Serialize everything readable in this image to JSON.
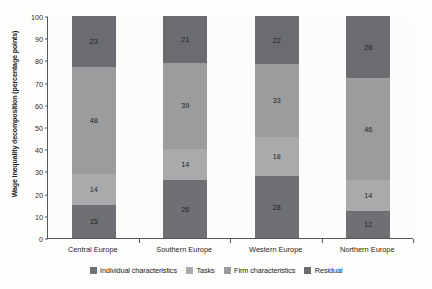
{
  "chart_data": {
    "type": "bar",
    "subtype": "stacked-bar",
    "title": "",
    "xlabel": "",
    "ylabel": "Wage inequality decomposition (percentage points)",
    "ylim": [
      0,
      100
    ],
    "ytick_step": 10,
    "yticks": [
      "100",
      "90",
      "80",
      "70",
      "60",
      "50",
      "40",
      "30",
      "20",
      "10",
      "0"
    ],
    "grid": false,
    "legend_position": "bottom-center",
    "categories": [
      "Central Europe",
      "Southern Europe",
      "Western Europe",
      "Northern Europe"
    ],
    "series": [
      {
        "name": "Individual characteristics",
        "color": "#6e7073",
        "values": [
          15,
          26,
          28,
          12
        ]
      },
      {
        "name": "Tasks",
        "color": "#a9aaac",
        "values": [
          14,
          14,
          18,
          14
        ]
      },
      {
        "name": "Firm characteristics",
        "color": "#9a9c9e",
        "values": [
          48,
          39,
          33,
          46
        ]
      },
      {
        "name": "Residual",
        "color": "#6a6c6f",
        "values": [
          23,
          21,
          22,
          28
        ]
      }
    ]
  },
  "legend": {
    "items": [
      {
        "label": "Individual characteristics",
        "color": "#6e7073"
      },
      {
        "label": "Tasks",
        "color": "#a9aaac"
      },
      {
        "label": "Firm characteristics",
        "color": "#9a9c9e"
      },
      {
        "label": "Residual",
        "color": "#6a6c6f"
      }
    ]
  },
  "axis": {
    "y_title": "Wage inequality decomposition (percentage points)",
    "axis_color": "#55565a"
  }
}
